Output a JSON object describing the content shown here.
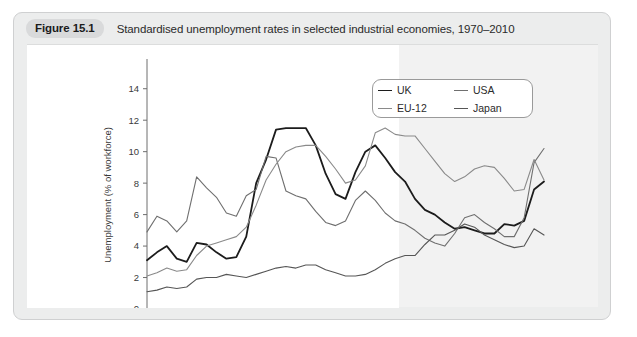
{
  "figure": {
    "badge": "Figure 15.1",
    "title": "Standardised unemployment rates in selected industrial economies, 1970–2010"
  },
  "legend": {
    "items": [
      {
        "label": "UK",
        "color": "#1c1c1c",
        "width": 1.8
      },
      {
        "label": "USA",
        "color": "#6f6f6f",
        "width": 1.1
      },
      {
        "label": "EU-12",
        "color": "#8a8a8a",
        "width": 1.1
      },
      {
        "label": "Japan",
        "color": "#565656",
        "width": 1.1
      }
    ]
  },
  "chart_data": {
    "type": "line",
    "title": "Standardised unemployment rates in selected industrial economies, 1970–2010",
    "xlabel": "",
    "ylabel": "Unemployment (% of workforce)",
    "xlim": [
      1970,
      2010
    ],
    "ylim": [
      0,
      15
    ],
    "yticks": [
      0,
      2,
      4,
      6,
      8,
      10,
      12,
      14
    ],
    "xticks": [
      1970,
      1975,
      1980,
      1985,
      1990,
      1995,
      2000,
      2005,
      2010
    ],
    "xtick_minor_step": 1,
    "grid": false,
    "legend_position": "top-right",
    "x": [
      1970,
      1971,
      1972,
      1973,
      1974,
      1975,
      1976,
      1977,
      1978,
      1979,
      1980,
      1981,
      1982,
      1983,
      1984,
      1985,
      1986,
      1987,
      1988,
      1989,
      1990,
      1991,
      1992,
      1993,
      1994,
      1995,
      1996,
      1997,
      1998,
      1999,
      2000,
      2001,
      2002,
      2003,
      2004,
      2005,
      2006,
      2007,
      2008,
      2009,
      2010
    ],
    "series": [
      {
        "name": "UK",
        "color": "#1c1c1c",
        "values": [
          3.1,
          3.6,
          4.0,
          3.2,
          3.0,
          4.2,
          4.1,
          3.6,
          3.2,
          3.3,
          4.6,
          8.0,
          9.5,
          11.4,
          11.5,
          11.5,
          11.5,
          10.4,
          8.6,
          7.3,
          7.0,
          8.7,
          10.0,
          10.4,
          9.6,
          8.7,
          8.1,
          7.0,
          6.3,
          6.0,
          5.5,
          5.1,
          5.2,
          5.0,
          4.8,
          4.8,
          5.4,
          5.3,
          5.6,
          7.6,
          8.1
        ]
      },
      {
        "name": "USA",
        "color": "#6f6f6f",
        "values": [
          4.9,
          5.9,
          5.6,
          4.9,
          5.6,
          8.4,
          7.7,
          7.1,
          6.1,
          5.9,
          7.2,
          7.6,
          9.7,
          9.6,
          7.5,
          7.2,
          7.0,
          6.2,
          5.5,
          5.3,
          5.6,
          6.9,
          7.5,
          6.9,
          6.1,
          5.6,
          5.4,
          5.0,
          4.5,
          4.2,
          4.0,
          4.8,
          5.8,
          6.0,
          5.5,
          5.1,
          4.6,
          4.6,
          5.8,
          9.3,
          10.2
        ]
      },
      {
        "name": "EU-12",
        "color": "#8a8a8a",
        "values": [
          2.1,
          2.3,
          2.6,
          2.4,
          2.5,
          3.4,
          4.0,
          4.2,
          4.4,
          4.6,
          5.2,
          6.6,
          8.2,
          9.2,
          10.0,
          10.3,
          10.4,
          10.4,
          9.7,
          8.9,
          8.0,
          8.2,
          9.1,
          11.2,
          11.5,
          11.1,
          11.0,
          11.0,
          10.2,
          9.4,
          8.6,
          8.1,
          8.4,
          8.9,
          9.1,
          9.0,
          8.3,
          7.5,
          7.6,
          9.5,
          8.2
        ]
      },
      {
        "name": "Japan",
        "color": "#565656",
        "values": [
          1.1,
          1.2,
          1.4,
          1.3,
          1.4,
          1.9,
          2.0,
          2.0,
          2.2,
          2.1,
          2.0,
          2.2,
          2.4,
          2.6,
          2.7,
          2.6,
          2.8,
          2.8,
          2.5,
          2.3,
          2.1,
          2.1,
          2.2,
          2.5,
          2.9,
          3.2,
          3.4,
          3.4,
          4.1,
          4.7,
          4.7,
          5.0,
          5.4,
          5.2,
          4.7,
          4.4,
          4.1,
          3.9,
          4.0,
          5.1,
          4.7
        ]
      }
    ]
  }
}
